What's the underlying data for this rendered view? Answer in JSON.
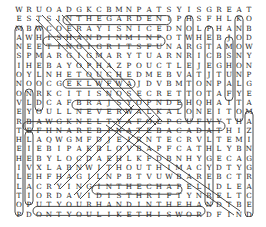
{
  "puzzle": {
    "rows": [
      "WRUOADGKCBMNPATSYISGREAT",
      "ESTSINTHEGARDENIPHSFHLKO",
      "MBWCOERAYISNICEDNOLPHANB",
      "AWHISHANDINMINPOTWHEBJOD",
      "NEETINGIGRITSFUNARGTAMOWN",
      "SPMARGIGMARYTUARNRICBSNY",
      "IHEBAYOPHAZPOUCTLEJEGHON",
      "OYLNHETOUCHEDMEBVATJTUNP",
      "NOOCGEKLWFWAJDVBMTONPALG",
      "ONRKCITISNOSECRETTOTAFYE",
      "VLDCAFBRAJSYOPNDEHQHAITA",
      "EYOULLNEVERWALKALONEITOM",
      "RBAWGKNELTYAFOLPCUFVYTHA",
      "TEFHNAREBINATEBACADATHIZ",
      "HLAQWGMFDJEIRNTECRVLTEMI",
      "EIEBIPAKBLOVBAPFCATHLYBN",
      "HEBYLOCDAEHLKFDBNHYGECAG",
      "IVXLABNWITHOUTHIMACYDTYG",
      "LEHFHAGILNPBTVUWBAREBCTR",
      "LACRYINGINTHECHAPELIDLEA",
      "TIORDAVIDISTHRIFTYNRELTC",
      "OPUTYOURHANDINTHEHANDTBE",
      "PDONTYOULIKETHISWORDFIND"
    ],
    "words_circled": [
      "IN THE GARDEN",
      "THE RAY IS NICE",
      "HIS HAND IN MINE",
      "HE TOUCHED ME",
      "IT IS NO SECRET",
      "YOU'LL NEVER WALK ALONE",
      "WITHOUT HIM",
      "CRYING IN THE CHAPEL",
      "DAVID",
      "PUT YOUR HAND IN THE HAND",
      "KNOWN ONLY HIM",
      "JOSHUA FIT THE BATTLE",
      "PEACE IN THE VALLEY",
      "HOW GREAT THOU ART",
      "AMAZING GRACE",
      "MANSION OVER THE HILLTOP",
      "MELODY",
      "ONLY",
      "BELIEVE",
      "OHIM",
      "HEART"
    ]
  }
}
